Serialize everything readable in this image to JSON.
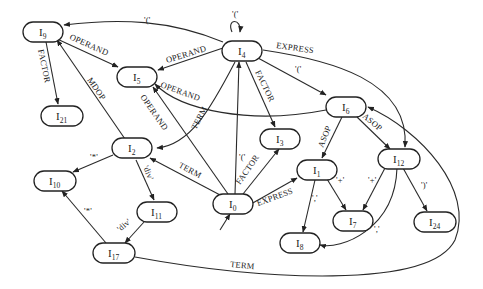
{
  "diagram": {
    "nodes": [
      {
        "id": "I0",
        "label": "I",
        "sub": "0",
        "x": 213,
        "y": 194
      },
      {
        "id": "I1",
        "label": "I",
        "sub": "1",
        "x": 297,
        "y": 160
      },
      {
        "id": "I2",
        "label": "I",
        "sub": "2",
        "x": 112,
        "y": 140
      },
      {
        "id": "I3",
        "label": "I",
        "sub": "3",
        "x": 260,
        "y": 129
      },
      {
        "id": "I4",
        "label": "I",
        "sub": "4",
        "x": 222,
        "y": 40
      },
      {
        "id": "I5",
        "label": "I",
        "sub": "5",
        "x": 117,
        "y": 67
      },
      {
        "id": "I6",
        "label": "I",
        "sub": "6",
        "x": 326,
        "y": 97
      },
      {
        "id": "I7",
        "label": "I",
        "sub": "7",
        "x": 332,
        "y": 211
      },
      {
        "id": "I8",
        "label": "I",
        "sub": "8",
        "x": 258,
        "y": 226
      },
      {
        "id": "I9",
        "label": "I",
        "sub": "9",
        "x": 23,
        "y": 22
      },
      {
        "id": "I10",
        "label": "I",
        "sub": "10",
        "x": 34,
        "y": 171
      },
      {
        "id": "I11",
        "label": "I",
        "sub": "11",
        "x": 137,
        "y": 201
      },
      {
        "id": "I12",
        "label": "I",
        "sub": "12",
        "x": 379,
        "y": 149
      },
      {
        "id": "I17",
        "label": "I",
        "sub": "17",
        "x": 93,
        "y": 243
      },
      {
        "id": "I21",
        "label": "I",
        "sub": "21",
        "x": 41,
        "y": 106
      },
      {
        "id": "I24",
        "label": "I",
        "sub": "24",
        "x": 414,
        "y": 212
      }
    ],
    "edge_labels": {
      "i4_i9": "'('",
      "i4_self": "'('",
      "i4_i12": "EXPRESS",
      "i4_i6": "'('",
      "i4_i3": "FACTOR",
      "i4_i5": "OPERAND",
      "i4_i2": "TERM",
      "i9_i5": "OPERAND",
      "i9_i21": "FACTOR",
      "i2_i9": "MDOP",
      "i6_i5": "OPERAND",
      "i0_i5": "OPERAND",
      "i0_i4": "'('",
      "i0_i3": "FACTOR",
      "i0_i2": "TERM",
      "i0_i1": "EXPRESS",
      "i6_i1": "ASOP",
      "i6_i12": "ASOP",
      "i2_i10": "'*'",
      "i2_i11": "'div'",
      "i17_i10": "'*'",
      "i11_i17": "'div'",
      "i1_i7": "'+'",
      "i12_i7": "'+'",
      "i1_i8": "','",
      "i12_i8": "','",
      "i12_i24": "')'",
      "i17_i6": "TERM"
    }
  }
}
